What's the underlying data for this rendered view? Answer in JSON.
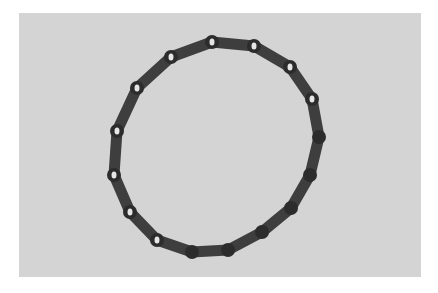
{
  "image": {
    "description": "3D render of a closed ring made of linked cylindrical rod segments on a gray background",
    "background_color": "#d4d4d4",
    "ring_color": "#3e3e3e",
    "joint_color": "#2c2c2c",
    "hole_color": "#e6e6e6",
    "highlight_color": "#8a8a8a"
  },
  "ring": {
    "joints": [
      {
        "x": 212,
        "y": 42,
        "hole": true
      },
      {
        "x": 254,
        "y": 46,
        "hole": true
      },
      {
        "x": 290,
        "y": 67,
        "hole": true
      },
      {
        "x": 312,
        "y": 99,
        "hole": true
      },
      {
        "x": 319,
        "y": 137,
        "hole": false
      },
      {
        "x": 310,
        "y": 175,
        "hole": false
      },
      {
        "x": 291,
        "y": 208,
        "hole": false
      },
      {
        "x": 262,
        "y": 232,
        "hole": false
      },
      {
        "x": 228,
        "y": 250,
        "hole": false
      },
      {
        "x": 192,
        "y": 252,
        "hole": false
      },
      {
        "x": 157,
        "y": 240,
        "hole": true
      },
      {
        "x": 130,
        "y": 212,
        "hole": true
      },
      {
        "x": 114,
        "y": 175,
        "hole": true
      },
      {
        "x": 117,
        "y": 131,
        "hole": true
      },
      {
        "x": 137,
        "y": 88,
        "hole": true
      },
      {
        "x": 171,
        "y": 57,
        "hole": true
      }
    ]
  }
}
